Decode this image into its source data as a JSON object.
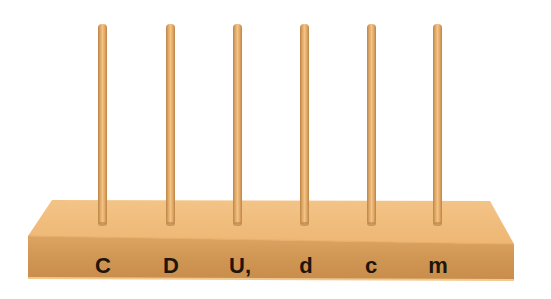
{
  "scene": {
    "description": "Wooden abacus-style board with six vertical pegs",
    "colors": {
      "background": "#ffffff",
      "board_top": "#f1be7c",
      "board_front": "#d49a5a",
      "board_side": "#c88d4e",
      "peg_light": "#f3c386",
      "peg_dark": "#b8844a",
      "label": "#1e150c"
    }
  },
  "pegs": [
    {
      "x": 102,
      "label": "C"
    },
    {
      "x": 170,
      "label": "D"
    },
    {
      "x": 237,
      "label": "U,"
    },
    {
      "x": 304,
      "label": "d"
    },
    {
      "x": 371,
      "label": "c"
    },
    {
      "x": 437,
      "label": "m"
    }
  ]
}
